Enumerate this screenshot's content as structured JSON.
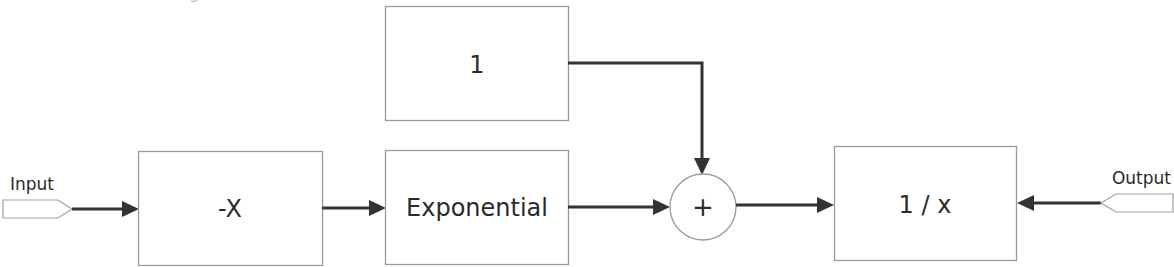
{
  "diagram": {
    "title_fragment": "g",
    "ports": {
      "input": {
        "label": "Input"
      },
      "output": {
        "label": "Output"
      }
    },
    "blocks": [
      {
        "id": "negate",
        "label": "-X"
      },
      {
        "id": "exponential",
        "label": "Exponential"
      },
      {
        "id": "constant",
        "label": "1"
      },
      {
        "id": "reciprocal",
        "label": "1 / x"
      }
    ],
    "sum": {
      "label": "+"
    },
    "connections": [
      {
        "from": "input",
        "to": "negate"
      },
      {
        "from": "negate",
        "to": "exponential"
      },
      {
        "from": "exponential",
        "to": "sum"
      },
      {
        "from": "constant",
        "to": "sum"
      },
      {
        "from": "sum",
        "to": "reciprocal"
      },
      {
        "from": "output",
        "to": "reciprocal"
      }
    ],
    "colors": {
      "text": "#2a2a2a",
      "border": "#9a9a9a",
      "wire": "#333333",
      "background": "#ffffff"
    }
  }
}
